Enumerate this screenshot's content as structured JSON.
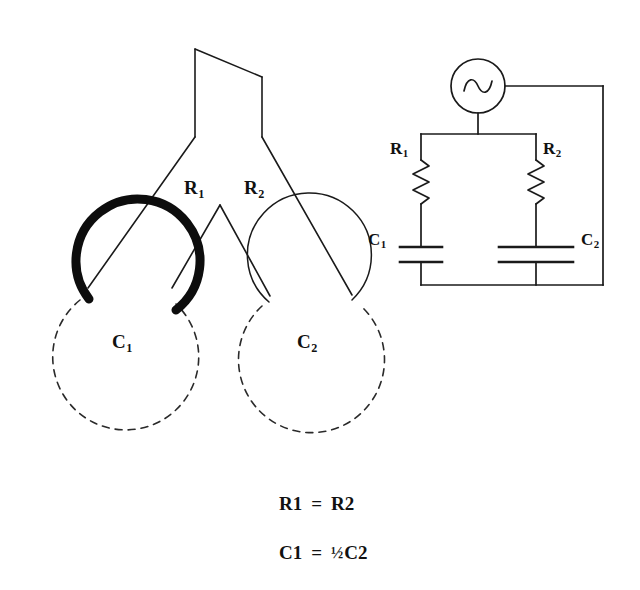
{
  "figure": {
    "background_color": "#ffffff",
    "stroke_color": "#1a1a1a"
  },
  "branch_diagram": {
    "name": "branching-teardrop-network",
    "labels": {
      "r1": "R",
      "r1_sub": "1",
      "r2": "R",
      "r2_sub": "2",
      "c1": "C",
      "c1_sub": "1",
      "c2": "C",
      "c2_sub": "2"
    },
    "geometry": {
      "trunk_top_left_x": 195,
      "trunk_top_left_y": 49,
      "trunk_top_right_x": 262,
      "trunk_top_right_y": 77,
      "fork_y": 137,
      "inner_v_apex_x": 220,
      "inner_v_apex_y": 205,
      "c1_center_x": 128,
      "c1_center_y": 355,
      "c1_radius": 62,
      "c1_dash_center_x": 125,
      "c1_dash_center_y": 360,
      "c1_dash_radius": 73,
      "c1_stroke_width": 9,
      "c2_center_x": 313,
      "c2_center_y": 360,
      "c2_radius": 62,
      "c2_dash_center_x": 312,
      "c2_dash_center_y": 368,
      "c2_dash_radius": 73,
      "c2_stroke_width": 1.4
    }
  },
  "circuit_diagram": {
    "name": "equivalent-rc-circuit",
    "labels": {
      "r1": "R",
      "r1_sub": "1",
      "r2": "R",
      "r2_sub": "2",
      "c1": "C",
      "c1_sub": "1",
      "c2": "C",
      "c2_sub": "2"
    },
    "source": {
      "type": "ac-source",
      "symbol": "sine-wave",
      "center_x": 478,
      "center_y": 86,
      "radius": 27
    },
    "nodes": {
      "left_rail_x": 421,
      "right_rail_x": 603,
      "mid_rail_x": 536,
      "top_rail_y": 134,
      "bottom_rail_y": 285,
      "source_tap_y": 86
    },
    "capacitors": {
      "c1_plate_half_width": 21,
      "c2_plate_half_width": 37
    }
  },
  "equations": [
    {
      "name": "resistance-equality",
      "lhs": "R",
      "lhs_sub": "1",
      "op": "=",
      "rhs_coeff": "",
      "rhs": "R",
      "rhs_sub": "2"
    },
    {
      "name": "capacitance-relation",
      "lhs": "C",
      "lhs_sub": "1",
      "op": "=",
      "rhs_coeff": "½",
      "rhs": "C",
      "rhs_sub": "2"
    }
  ]
}
